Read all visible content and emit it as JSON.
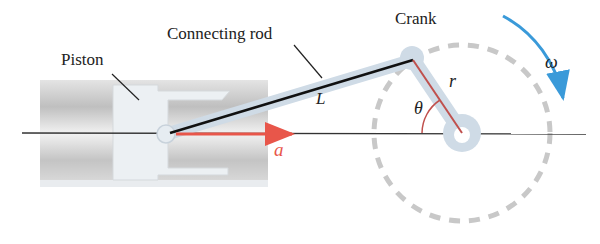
{
  "diagram": {
    "type": "slider-crank mechanism",
    "labels": {
      "piston": "Piston",
      "connecting_rod": "Connecting rod",
      "crank": "Crank",
      "rod_length": "L",
      "crank_radius": "r",
      "angle": "θ",
      "angular_velocity": "ω",
      "acceleration": "a"
    },
    "colors": {
      "rod_line": "#111111",
      "crank_line": "#c0504d",
      "accel_arrow": "#e8564a",
      "omega_arrow": "#3a9ad9",
      "dashed_circle": "#c8c8c8",
      "link_fill": "#cfdbe6",
      "cylinder": "#c9c9c9"
    }
  }
}
